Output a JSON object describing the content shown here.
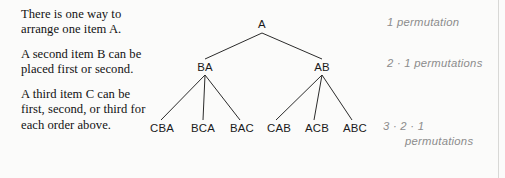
{
  "figure": {
    "title_text_paragraphs": [
      "There is one way to arrange one item A.",
      "A second item B can be placed first or second.",
      "A third item C can be first, second, or third for each order above."
    ]
  },
  "tree": {
    "root": {
      "label": "A"
    },
    "level2": [
      {
        "label": "BA"
      },
      {
        "label": "AB"
      }
    ],
    "leaves": [
      {
        "label": "CBA"
      },
      {
        "label": "BCA"
      },
      {
        "label": "BAC"
      },
      {
        "label": "CAB"
      },
      {
        "label": "ACB"
      },
      {
        "label": "ABC"
      }
    ]
  },
  "annotations": {
    "level1": "1 permutation",
    "level2": "2 · 1 permutations",
    "level3_line1": "3 · 2 · 1",
    "level3_line2": "permutations"
  },
  "colors": {
    "text": "#121212",
    "node_text": "#1a1a1a",
    "annotation_text": "#8c8c8c",
    "edge_line": "#2b2b2b",
    "background": "#fbfbfa",
    "rule": "#d8d8d6"
  }
}
